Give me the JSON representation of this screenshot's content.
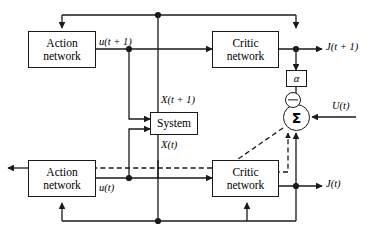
{
  "diagram": {
    "colors": {
      "line": "#1a1a1a",
      "box_border": "#1a1a1a",
      "background": "#ffffff",
      "text": "#000000"
    },
    "blocks": [
      {
        "id": "action-network-top",
        "line1": "Action",
        "line2": "network"
      },
      {
        "id": "critic-network-top",
        "line1": "Critic",
        "line2": "network"
      },
      {
        "id": "system",
        "line1": "System",
        "line2": ""
      },
      {
        "id": "action-network-bottom",
        "line1": "Action",
        "line2": "network"
      },
      {
        "id": "critic-network-bottom",
        "line1": "Critic",
        "line2": "network"
      }
    ],
    "operators": {
      "gain_label": "α",
      "sum_label": "Σ",
      "minus_label": "−"
    },
    "signals": {
      "u_t_plus_1": "u(t + 1)",
      "x_t_plus_1": "X(t + 1)",
      "x_t": "X(t)",
      "u_t": "u(t)",
      "j_t_plus_1": "J(t + 1)",
      "j_t": "J(t)",
      "u_big_t": "U(t)"
    }
  }
}
